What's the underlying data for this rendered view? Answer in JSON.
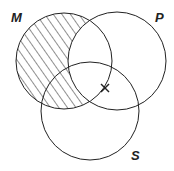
{
  "diagram": {
    "type": "venn",
    "sets": [
      {
        "id": "M",
        "label": "M",
        "cx": 64,
        "cy": 61,
        "r": 48
      },
      {
        "id": "P",
        "label": "P",
        "cx": 117,
        "cy": 61,
        "r": 49
      },
      {
        "id": "S",
        "label": "S",
        "cx": 90,
        "cy": 111,
        "r": 49
      }
    ],
    "shaded_region": "M minus P",
    "marker": {
      "symbol": "X",
      "x": 105,
      "y": 88,
      "region": "P ∩ S on boundary of M"
    },
    "colors": {
      "stroke": "#222222",
      "background": "#ffffff"
    }
  }
}
